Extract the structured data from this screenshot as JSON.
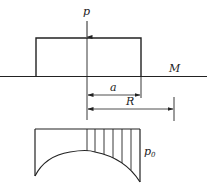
{
  "diagram": {
    "type": "foundation-pressure-distribution",
    "labels": {
      "load": "p",
      "ground": "M",
      "dim_a": "a",
      "dim_R": "R",
      "pressure_main": "p",
      "pressure_sub": "0"
    },
    "colors": {
      "line": "#222222",
      "background": "#ffffff"
    }
  }
}
